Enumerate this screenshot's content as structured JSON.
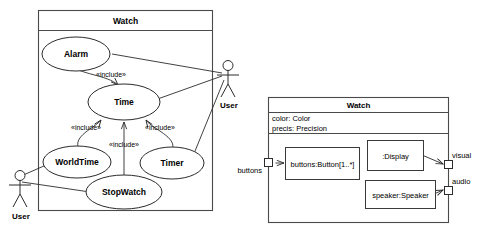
{
  "diagram": {
    "kind": "uml-use-case-and-composite-structure",
    "background_color": "#ffffff",
    "line_color": "#2b2b2b"
  },
  "use_case_diagram": {
    "system_name": "Watch",
    "use_cases": [
      {
        "id": "alarm",
        "label": "Alarm"
      },
      {
        "id": "time",
        "label": "Time"
      },
      {
        "id": "worldtime",
        "label": "WorldTime"
      },
      {
        "id": "timer",
        "label": "Timer"
      },
      {
        "id": "stopwatch",
        "label": "StopWatch"
      }
    ],
    "actors": [
      {
        "id": "actor-right",
        "label": "User"
      },
      {
        "id": "actor-left",
        "label": "User"
      }
    ],
    "include_labels": [
      {
        "id": "inc-alarm-time",
        "label": "«include»"
      },
      {
        "id": "inc-worldtime-time",
        "label": "«include»"
      },
      {
        "id": "inc-stopwatch-time",
        "label": "«include»"
      },
      {
        "id": "inc-timer-time",
        "label": "«include»"
      }
    ],
    "associations": [
      {
        "from": "actor-right",
        "to": "alarm"
      },
      {
        "from": "actor-right",
        "to": "time"
      },
      {
        "from": "actor-right",
        "to": "timer"
      },
      {
        "from": "actor-left",
        "to": "worldtime"
      },
      {
        "from": "actor-left",
        "to": "stopwatch"
      }
    ],
    "includes": [
      {
        "from": "alarm",
        "to": "time"
      },
      {
        "from": "worldtime",
        "to": "time"
      },
      {
        "from": "stopwatch",
        "to": "time"
      },
      {
        "from": "timer",
        "to": "time"
      }
    ]
  },
  "composite_structure_diagram": {
    "class_name": "Watch",
    "attributes": [
      "color: Color",
      "precis: Precision"
    ],
    "parts": [
      {
        "id": "part-buttons",
        "label": "buttons:Button[1..*]"
      },
      {
        "id": "part-display",
        "label": ":Display"
      },
      {
        "id": "part-speaker",
        "label": "speaker:Speaker"
      }
    ],
    "ports": [
      {
        "id": "port-buttons",
        "label": "buttons",
        "side": "left"
      },
      {
        "id": "port-visual",
        "label": "visual",
        "side": "right"
      },
      {
        "id": "port-audio",
        "label": "audio",
        "side": "right"
      }
    ],
    "connectors": [
      {
        "from": "port-buttons",
        "to": "part-buttons"
      },
      {
        "from": "part-display",
        "to": "port-visual"
      },
      {
        "from": "part-speaker",
        "to": "port-audio"
      }
    ]
  }
}
